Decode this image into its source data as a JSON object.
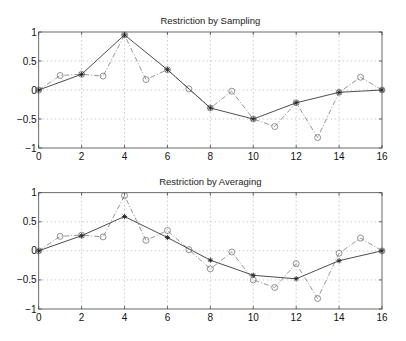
{
  "chart_data": [
    {
      "type": "line",
      "title": "Restriction by Sampling",
      "xlabel": "",
      "ylabel": "",
      "xlim": [
        0,
        16
      ],
      "ylim": [
        -1,
        1
      ],
      "xticks": [
        0,
        2,
        4,
        6,
        8,
        10,
        12,
        14,
        16
      ],
      "yticks": [
        -1,
        -0.5,
        0,
        0.5,
        1
      ],
      "ytick_labels": [
        "−1",
        "−0.5",
        "0",
        "0.5",
        "1"
      ],
      "grid": true,
      "series": [
        {
          "name": "fine grid",
          "style": "dash-dot with open circle markers",
          "color": "#888888",
          "x": [
            0,
            1,
            2,
            3,
            4,
            5,
            6,
            7,
            8,
            9,
            10,
            11,
            12,
            13,
            14,
            15,
            16
          ],
          "values": [
            0,
            0.25,
            0.27,
            0.24,
            0.95,
            0.18,
            0.35,
            0.02,
            -0.31,
            -0.02,
            -0.5,
            -0.63,
            -0.22,
            -0.82,
            -0.04,
            0.22,
            0.0
          ]
        },
        {
          "name": "coarse grid (sampled)",
          "style": "solid with star markers",
          "color": "#333333",
          "x": [
            0,
            2,
            4,
            6,
            8,
            10,
            12,
            14,
            16
          ],
          "values": [
            0,
            0.27,
            0.95,
            0.35,
            -0.31,
            -0.5,
            -0.22,
            -0.04,
            0.0
          ]
        }
      ]
    },
    {
      "type": "line",
      "title": "Restriction by Averaging",
      "xlabel": "",
      "ylabel": "",
      "xlim": [
        0,
        16
      ],
      "ylim": [
        -1,
        1
      ],
      "xticks": [
        0,
        2,
        4,
        6,
        8,
        10,
        12,
        14,
        16
      ],
      "yticks": [
        -1,
        -0.5,
        0,
        0.5,
        1
      ],
      "ytick_labels": [
        "−1",
        "−0.5",
        "0",
        "0.5",
        "1"
      ],
      "grid": true,
      "series": [
        {
          "name": "fine grid",
          "style": "dash-dot with open circle markers",
          "color": "#888888",
          "x": [
            0,
            1,
            2,
            3,
            4,
            5,
            6,
            7,
            8,
            9,
            10,
            11,
            12,
            13,
            14,
            15,
            16
          ],
          "values": [
            0,
            0.25,
            0.27,
            0.24,
            0.95,
            0.18,
            0.35,
            0.02,
            -0.31,
            -0.02,
            -0.5,
            -0.63,
            -0.22,
            -0.82,
            -0.04,
            0.22,
            0.0
          ]
        },
        {
          "name": "coarse grid (averaged)",
          "style": "solid with star markers",
          "color": "#333333",
          "x": [
            0,
            2,
            4,
            6,
            8,
            10,
            12,
            14,
            16
          ],
          "values": [
            0,
            0.26,
            0.59,
            0.23,
            -0.16,
            -0.42,
            -0.48,
            -0.17,
            0.0
          ]
        }
      ]
    }
  ],
  "layout": {
    "panels": [
      {
        "left": 38.7,
        "right": 382,
        "top": 32,
        "bottom": 148,
        "title_y": 24
      },
      {
        "left": 38.7,
        "right": 382,
        "top": 192.7,
        "bottom": 309,
        "title_y": 185
      }
    ]
  }
}
